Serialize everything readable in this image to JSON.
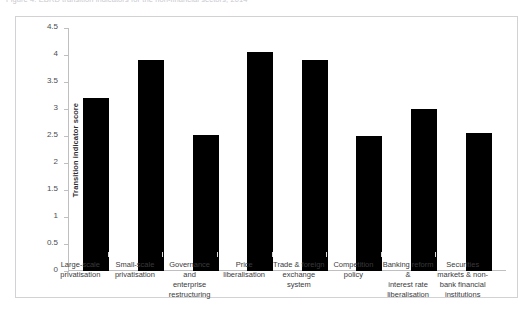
{
  "caption": {
    "text": "Figure 4: EBRD transition indicators for the non-financial sectors, 2014"
  },
  "chart_data": {
    "type": "bar",
    "title": "",
    "xlabel": "",
    "ylabel": "Transition indicator score",
    "ylim": [
      0,
      4.5
    ],
    "ytick_step": 0.5,
    "ytick_labels": [
      "0",
      "0.5",
      "1",
      "1.5",
      "2",
      "2.5",
      "3",
      "3.5",
      "4",
      "4.5"
    ],
    "ytick_values": [
      0,
      0.5,
      1,
      1.5,
      2,
      2.5,
      3,
      3.5,
      4,
      4.5
    ],
    "grid": false,
    "legend": "none",
    "bar_color": "#000000",
    "categories": [
      "Large-scale privatisation",
      "Small-scale privatisation",
      "Governance and enterprise restructuring",
      "Price liberalisation",
      "Trade & foreign exchange system",
      "Competition policy",
      "Banking reform & interest rate liberalisation",
      "Securities markets & non-bank financial institutions"
    ],
    "category_lines": [
      [
        "Large-scale",
        "privatisation"
      ],
      [
        "Small-scale",
        "privatisation"
      ],
      [
        "Governance and",
        "enterprise",
        "restructuring"
      ],
      [
        "Price",
        "liberalisation"
      ],
      [
        "Trade & foreign",
        "exchange system"
      ],
      [
        "Competition",
        "policy"
      ],
      [
        "Banking reform &",
        "interest rate",
        "liberalisation"
      ],
      [
        "Securities",
        "markets & non-",
        "bank financial",
        "institutions"
      ]
    ],
    "values": [
      3.2,
      3.9,
      2.52,
      4.05,
      3.9,
      2.5,
      3.0,
      2.55
    ]
  },
  "colors": {
    "bar": "#000000",
    "frame": "#d2d2d4",
    "axis": "#bfbfc2",
    "text": "#3a3a3c",
    "background": "#ffffff"
  }
}
